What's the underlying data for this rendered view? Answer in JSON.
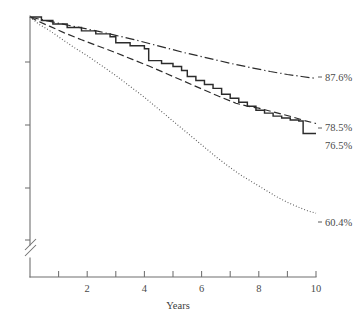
{
  "chart_data": {
    "type": "line",
    "title": "",
    "subtitle": "",
    "xlabel": "Years",
    "ylabel": "",
    "xlim": [
      0,
      10
    ],
    "ylim": [
      55,
      100
    ],
    "grid": false,
    "legend_position": "end-of-line-labels",
    "x_tick_labels": [
      "2",
      "4",
      "6",
      "8",
      "10"
    ],
    "x_tick_values": [
      2,
      4,
      6,
      8,
      10
    ],
    "x_minor_tick_values": [
      1,
      3,
      5,
      7,
      9
    ],
    "y_tick_values": [
      95,
      90,
      85,
      80
    ],
    "y_tick_labels": [
      "",
      "",
      "",
      ""
    ],
    "y_axis_break": true,
    "annotations": [
      {
        "text": "87.6%",
        "series": "dash-dot",
        "x": 10,
        "y": 87.6
      },
      {
        "text": "78.5%",
        "series": "dashed",
        "x": 10,
        "y": 78.5
      },
      {
        "text": "76.5%",
        "series": "solid",
        "x": 10,
        "y": 76.5
      },
      {
        "text": "60.4%",
        "series": "dotted",
        "x": 10,
        "y": 60.4
      }
    ],
    "series": [
      {
        "name": "dash-dot",
        "style": "dash-dot",
        "endpoint_label": "87.6%",
        "x": [
          0,
          0.3,
          0.7,
          1.2,
          1.8,
          2.4,
          3.0,
          3.6,
          4.2,
          4.8,
          5.4,
          6.0,
          6.6,
          7.2,
          7.8,
          8.4,
          9.0,
          9.5,
          10.0
        ],
        "values": [
          100,
          99.6,
          99.1,
          98.5,
          97.8,
          97.1,
          96.3,
          95.5,
          94.6,
          93.7,
          92.8,
          92.0,
          91.2,
          90.4,
          89.7,
          89.0,
          88.4,
          88.0,
          87.6
        ]
      },
      {
        "name": "dashed",
        "style": "dashed",
        "endpoint_label": "78.5%",
        "x": [
          0,
          0.3,
          0.7,
          1.2,
          1.8,
          2.4,
          3.0,
          3.6,
          4.2,
          4.8,
          5.4,
          6.0,
          6.6,
          7.2,
          7.6,
          8.0,
          8.6,
          9.2,
          9.6,
          10.0
        ],
        "values": [
          100,
          99.1,
          98.1,
          96.8,
          95.4,
          94.1,
          92.8,
          91.4,
          90.0,
          88.5,
          87.0,
          85.5,
          84.0,
          82.6,
          82.0,
          81.6,
          80.7,
          79.8,
          79.1,
          78.5
        ]
      },
      {
        "name": "solid",
        "style": "solid-step",
        "endpoint_label": "76.5%",
        "x": [
          0,
          0.4,
          0.8,
          1.3,
          1.8,
          2.3,
          2.8,
          3.0,
          3.5,
          4.0,
          4.15,
          4.6,
          5.0,
          5.3,
          5.5,
          5.8,
          6.1,
          6.4,
          6.7,
          7.0,
          7.3,
          7.6,
          7.9,
          8.2,
          8.5,
          8.8,
          9.1,
          9.4,
          9.55,
          10.0
        ],
        "values": [
          100,
          99.3,
          98.6,
          97.9,
          97.2,
          96.6,
          96.0,
          94.8,
          94.2,
          93.6,
          91.2,
          90.6,
          90.0,
          89.2,
          88.0,
          87.2,
          86.4,
          85.6,
          84.4,
          83.6,
          82.8,
          82.0,
          81.2,
          80.6,
          80.0,
          79.6,
          79.2,
          79.0,
          76.5,
          76.5
        ]
      },
      {
        "name": "dotted",
        "style": "dotted",
        "endpoint_label": "60.4%",
        "x": [
          0,
          0.3,
          0.7,
          1.1,
          1.5,
          2.0,
          2.5,
          3.0,
          3.5,
          4.0,
          4.5,
          5.0,
          5.5,
          6.0,
          6.5,
          7.0,
          7.4,
          7.8,
          8.2,
          8.6,
          9.0,
          9.4,
          9.7,
          10.0
        ],
        "values": [
          100,
          98.6,
          97.2,
          95.6,
          94.0,
          92.2,
          90.2,
          88.2,
          86.0,
          83.8,
          81.4,
          79.0,
          76.6,
          74.2,
          71.8,
          69.6,
          68.0,
          66.6,
          65.2,
          63.8,
          62.6,
          61.6,
          60.9,
          60.4
        ]
      }
    ]
  },
  "axis": {
    "x_title": "Years",
    "labels": {
      "t2": "2",
      "t4": "4",
      "t6": "6",
      "t8": "8",
      "t10": "10"
    }
  },
  "endpoint_labels": {
    "dashdot": "87.6%",
    "dashed": "78.5%",
    "solid": "76.5%",
    "dotted": "60.4%"
  }
}
